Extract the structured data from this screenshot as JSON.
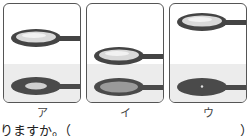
{
  "figure": {
    "panels": [
      {
        "label": "ア",
        "top_lens": "clear",
        "shadow": "ring-with-light-center"
      },
      {
        "label": "イ",
        "top_lens": "clear",
        "shadow": "ring-with-gray-center"
      },
      {
        "label": "ウ",
        "top_lens": "clear",
        "shadow": "dark-with-bright-dot"
      }
    ],
    "colors": {
      "frame": "#444444",
      "lens_fill": "#d9d9d9",
      "lens_highlight": "#f2f2f2",
      "shade": "#ececec",
      "shadow_dark": "#4a4a4a",
      "shadow_mid": "#9a9a9a",
      "shadow_light": "#d0d0d0"
    }
  },
  "text": {
    "question_tail": "りますか。（",
    "paren_close": "）"
  }
}
